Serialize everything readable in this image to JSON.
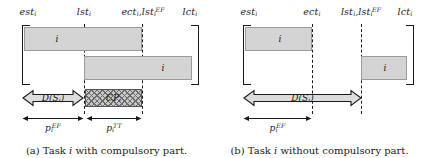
{
  "figure": {
    "panels": [
      {
        "id": "a",
        "caption_prefix": "(a) Task",
        "caption_var": "i",
        "caption_suffix": "with compulsory part.",
        "ticks": [
          {
            "name": "est",
            "base": "est",
            "sub": "i",
            "sup": ""
          },
          {
            "name": "lst",
            "base": "lst",
            "sub": "i",
            "sup": ""
          },
          {
            "name": "ect_lstEF",
            "base": "ect",
            "sub": "i",
            "sup": "",
            "extra_base": "lst",
            "extra_sub": "i",
            "extra_sup": "EF",
            "separator": ","
          },
          {
            "name": "lct",
            "base": "lct",
            "sub": "i",
            "sup": ""
          }
        ],
        "bars": [
          {
            "name": "earliest-start-bar",
            "label": "i"
          },
          {
            "name": "latest-start-bar",
            "label": "i"
          }
        ],
        "compulsory_part": {
          "base": "CP",
          "sub": "i"
        },
        "duration_arrow": {
          "base": "D(S",
          "sub": "i",
          "tail": ")"
        },
        "measures": [
          {
            "base": "p",
            "sub": "i",
            "sup": "EF"
          },
          {
            "base": "p",
            "sub": "i",
            "sup": "TT"
          }
        ]
      },
      {
        "id": "b",
        "caption_prefix": "(b) Task",
        "caption_var": "i",
        "caption_suffix": "without compulsory part.",
        "ticks": [
          {
            "name": "est",
            "base": "est",
            "sub": "i",
            "sup": ""
          },
          {
            "name": "ect",
            "base": "ect",
            "sub": "i",
            "sup": ""
          },
          {
            "name": "lst_lstEF",
            "base": "lst",
            "sub": "i",
            "sup": "",
            "extra_base": "lst",
            "extra_sub": "i",
            "extra_sup": "EF",
            "separator": ","
          },
          {
            "name": "lct",
            "base": "lct",
            "sub": "i",
            "sup": ""
          }
        ],
        "bars": [
          {
            "name": "earliest-start-bar",
            "label": "i"
          },
          {
            "name": "latest-start-bar",
            "label": "i"
          }
        ],
        "compulsory_part": null,
        "duration_arrow": {
          "base": "D(S",
          "sub": "i",
          "tail": ")"
        },
        "measures": [
          {
            "base": "p",
            "sub": "i",
            "sup": "EF"
          }
        ]
      }
    ],
    "colors": {
      "bar_fill": "#d4d4d4",
      "bar_border": "#9a9a9a",
      "line": "#1a1a1a",
      "cp_fill": "#c8c8c8",
      "cp_hatch": "#6b6b6b",
      "background": "#ffffff"
    }
  }
}
